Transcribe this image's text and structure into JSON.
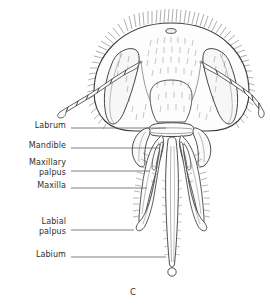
{
  "figure": {
    "caption": "C",
    "background_color": "#ffffff",
    "ink_color": "#3a3a3a",
    "text_color": "#2e2e2e"
  },
  "labels": [
    {
      "id": "labrum",
      "text": "Labrum",
      "text_x": 66,
      "text_y": 121,
      "line_y": 128,
      "line_x1": 71,
      "line_x2": 166
    },
    {
      "id": "mandible",
      "text": "Mandible",
      "text_x": 66,
      "text_y": 141,
      "line_y": 148,
      "line_x1": 71,
      "line_x2": 160
    },
    {
      "id": "maxillary-palpus",
      "text": "Maxillary\npalpus",
      "text_x": 66,
      "text_y": 158,
      "line_y": 171,
      "line_x1": 71,
      "line_x2": 150
    },
    {
      "id": "maxilla",
      "text": "Maxilla",
      "text_x": 66,
      "text_y": 181,
      "line_y": 188,
      "line_x1": 71,
      "line_x2": 147
    },
    {
      "id": "labial-palpus",
      "text": "Labial\npalpus",
      "text_x": 66,
      "text_y": 217,
      "line_y": 230,
      "line_x1": 71,
      "line_x2": 134
    },
    {
      "id": "labium",
      "text": "Labium",
      "text_x": 66,
      "text_y": 250,
      "line_y": 257,
      "line_x1": 71,
      "line_x2": 166
    }
  ],
  "caption_pos": {
    "x": 130,
    "y": 287
  }
}
